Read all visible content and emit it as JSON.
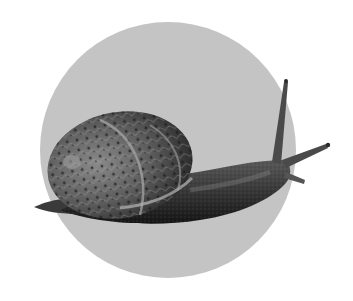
{
  "image": {
    "subject": "Garden snail on a grey circular background",
    "alt": "Grayscale photo of a snail crawling right with its shell on the left and eye stalks extended",
    "colors": {
      "background": "#ffffff",
      "circle": "#c4c4c4",
      "shell_dark": "#2e2e2e",
      "shell_mid": "#6a6a6a",
      "shell_light": "#9a9a9a",
      "body_dark": "#1e1e1e",
      "body_mid": "#4a4a4a",
      "body_light": "#7a7a7a"
    }
  }
}
